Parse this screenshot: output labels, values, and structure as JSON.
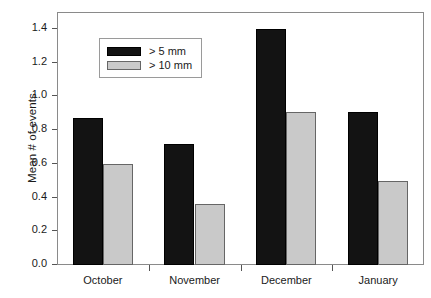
{
  "chart_data": {
    "type": "bar",
    "title": "",
    "subtitle": "",
    "xlabel": "",
    "ylabel": "Mean # of events",
    "categories": [
      "October",
      "November",
      "December",
      "January"
    ],
    "series": [
      {
        "name": "> 5 mm",
        "color": "#131313",
        "values": [
          0.87,
          0.72,
          1.4,
          0.91
        ]
      },
      {
        "name": "> 10 mm",
        "color": "#c9c9c9",
        "values": [
          0.6,
          0.36,
          0.91,
          0.5
        ]
      }
    ],
    "ylim": [
      0.0,
      1.5
    ],
    "yticks": [
      0.0,
      0.2,
      0.4,
      0.6,
      0.8,
      1.0,
      1.2,
      1.4
    ],
    "ytick_labels": [
      "0.0",
      "0.2",
      "0.4",
      "0.6",
      "0.8",
      "1.0",
      "1.2",
      "1.4"
    ],
    "grid": false,
    "legend_position": "upper center-left",
    "frame": true
  }
}
